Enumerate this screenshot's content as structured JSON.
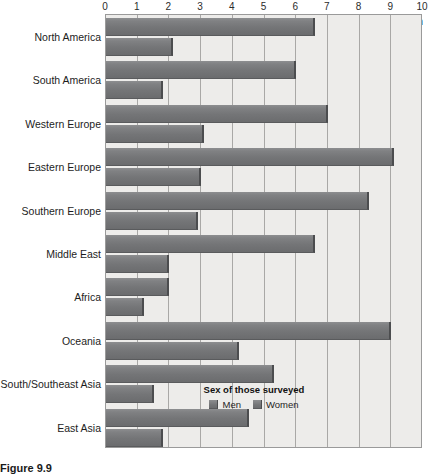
{
  "caption": "Figure 9.9",
  "axis_title": "World region",
  "legend": {
    "title": "Sex of those surveyed",
    "items": [
      {
        "label": "Men"
      },
      {
        "label": "Women"
      }
    ]
  },
  "chart_data": {
    "type": "bar",
    "orientation": "horizontal",
    "title": "",
    "subtitle": "",
    "xlabel": "",
    "ylabel": "World region",
    "xlim": [
      0,
      10
    ],
    "xticks": [
      "0",
      "1",
      "2",
      "3",
      "4",
      "5",
      "6",
      "7",
      "8",
      "9",
      "10"
    ],
    "grid": true,
    "legend_position": "inside-bottom-right",
    "categories": [
      "North America",
      "South America",
      "Western Europe",
      "Eastern Europe",
      "Southern Europe",
      "Middle East",
      "Africa",
      "Oceania",
      "South/Southeast Asia",
      "East Asia"
    ],
    "series": [
      {
        "name": "Men",
        "color": "#77787a",
        "values": [
          6.6,
          6.0,
          7.0,
          9.1,
          8.3,
          6.6,
          2.0,
          9.0,
          5.3,
          4.5
        ]
      },
      {
        "name": "Women",
        "color": "#77787a",
        "values": [
          2.1,
          1.8,
          3.1,
          3.0,
          2.9,
          2.0,
          1.2,
          4.2,
          1.5,
          1.8
        ]
      }
    ]
  }
}
